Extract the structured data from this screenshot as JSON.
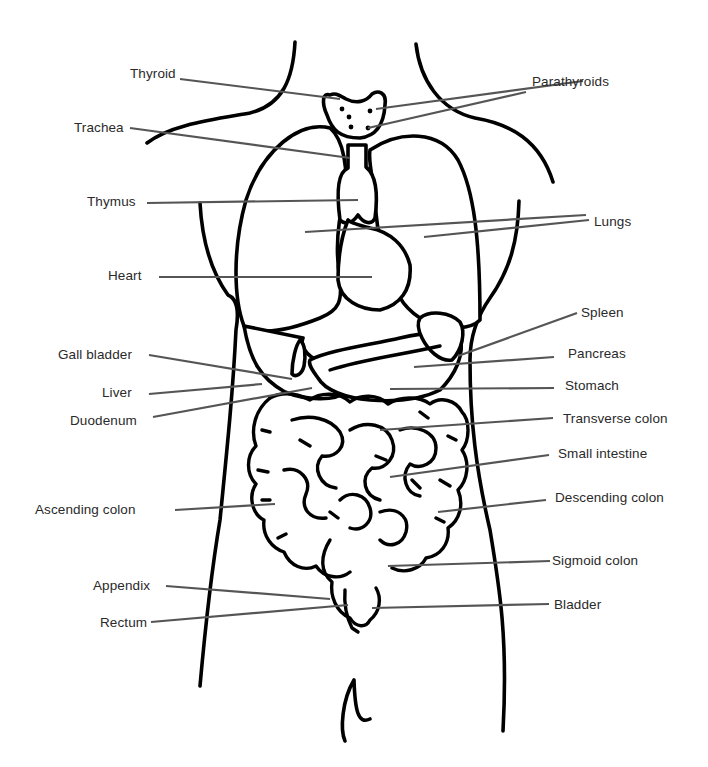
{
  "diagram": {
    "leader_color": "#555555",
    "outline_color": "#000000",
    "labels_left": [
      {
        "id": "thyroid",
        "text": "Thyroid",
        "x": 130,
        "y": 66
      },
      {
        "id": "trachea",
        "text": "Trachea",
        "x": 74,
        "y": 120
      },
      {
        "id": "thymus",
        "text": "Thymus",
        "x": 87,
        "y": 194
      },
      {
        "id": "heart",
        "text": "Heart",
        "x": 108,
        "y": 268
      },
      {
        "id": "gall-bladder",
        "text": "Gall bladder",
        "x": 58,
        "y": 347
      },
      {
        "id": "liver",
        "text": "Liver",
        "x": 102,
        "y": 385
      },
      {
        "id": "duodenum",
        "text": "Duodenum",
        "x": 70,
        "y": 413
      },
      {
        "id": "ascending-colon",
        "text": "Ascending colon",
        "x": 35,
        "y": 502
      },
      {
        "id": "appendix",
        "text": "Appendix",
        "x": 93,
        "y": 578
      },
      {
        "id": "rectum",
        "text": "Rectum",
        "x": 100,
        "y": 615
      }
    ],
    "labels_right": [
      {
        "id": "parathyroids",
        "text": "Parathyroids",
        "x": 532,
        "y": 74
      },
      {
        "id": "lungs",
        "text": "Lungs",
        "x": 594,
        "y": 214
      },
      {
        "id": "spleen",
        "text": "Spleen",
        "x": 581,
        "y": 305
      },
      {
        "id": "pancreas",
        "text": "Pancreas",
        "x": 568,
        "y": 346
      },
      {
        "id": "stomach",
        "text": "Stomach",
        "x": 565,
        "y": 378
      },
      {
        "id": "transverse-colon",
        "text": "Transverse colon",
        "x": 563,
        "y": 411
      },
      {
        "id": "small-intestine",
        "text": "Small intestine",
        "x": 558,
        "y": 446
      },
      {
        "id": "descending-colon",
        "text": "Descending colon",
        "x": 555,
        "y": 490
      },
      {
        "id": "sigmoid-colon",
        "text": "Sigmoid colon",
        "x": 552,
        "y": 553
      },
      {
        "id": "bladder",
        "text": "Bladder",
        "x": 554,
        "y": 597
      }
    ]
  }
}
